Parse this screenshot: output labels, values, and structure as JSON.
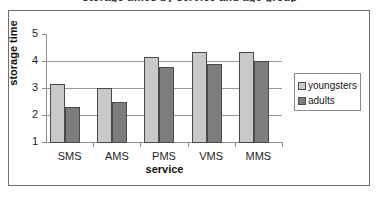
{
  "title_remnant": "storage times by service and age group",
  "legend": {
    "position": "right",
    "entries": [
      {
        "label": "youngsters",
        "color": "#c9c9c9"
      },
      {
        "label": "adults",
        "color": "#7d7d7d"
      }
    ]
  },
  "axes": {
    "y_ticks": [
      "5",
      "4",
      "3",
      "2",
      "1"
    ],
    "x_ticks": [
      "SMS",
      "AMS",
      "PMS",
      "VMS",
      "MMS"
    ],
    "y_label": "storage time",
    "x_label": "service"
  },
  "chart_data": {
    "type": "bar",
    "title": "",
    "xlabel": "service",
    "ylabel": "storage time",
    "ylim": [
      1,
      5
    ],
    "yticks": [
      1,
      2,
      3,
      4,
      5
    ],
    "grid": true,
    "legend_position": "right",
    "categories": [
      "SMS",
      "AMS",
      "PMS",
      "VMS",
      "MMS"
    ],
    "series": [
      {
        "name": "youngsters",
        "color": "#c9c9c9",
        "values": [
          3.15,
          3.0,
          4.15,
          4.33,
          4.33
        ]
      },
      {
        "name": "adults",
        "color": "#7d7d7d",
        "values": [
          2.3,
          2.5,
          3.78,
          3.9,
          4.0
        ]
      }
    ]
  }
}
